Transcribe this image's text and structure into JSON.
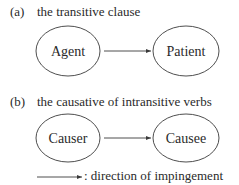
{
  "panels": [
    {
      "label": "(a)",
      "title": "the transitive clause",
      "source": "Agent",
      "target": "Patient"
    },
    {
      "label": "(b)",
      "title": "the causative of intransitive verbs",
      "source": "Causer",
      "target": "Causee"
    }
  ],
  "legend": {
    "symbol": "arrow",
    "text": ": direction of impingement"
  },
  "colors": {
    "stroke": "#3a3a3a",
    "text": "#2a2a2a",
    "background": "#ffffff"
  }
}
